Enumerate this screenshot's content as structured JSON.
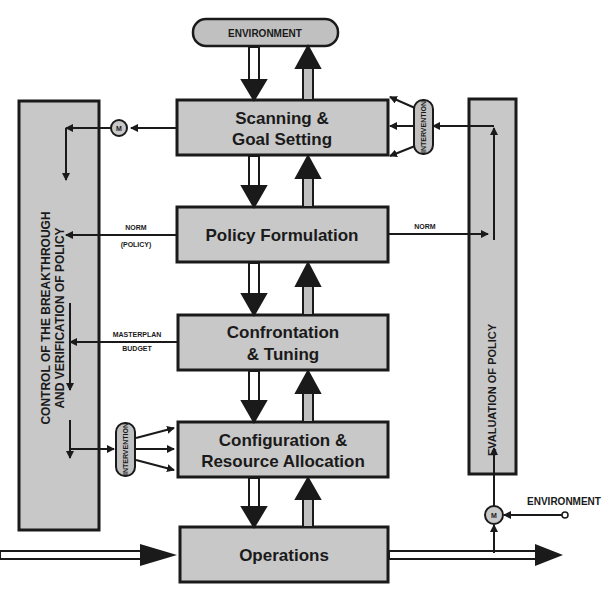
{
  "diagram": {
    "environment_top": "ENVIRONMENT",
    "environment_right": "ENVIRONMENT",
    "boxes": [
      {
        "line1": "Scanning &",
        "line2": "Goal Setting"
      },
      {
        "line1": "Policy Formulation",
        "line2": ""
      },
      {
        "line1": "Confrontation",
        "line2": "& Tuning"
      },
      {
        "line1": "Configuration &",
        "line2": "Resource Allocation"
      },
      {
        "line1": "Operations",
        "line2": ""
      }
    ],
    "left_panel": {
      "line1": "CONTROL OF THE BREAKTHROUGH",
      "line2": "AND VERIFICATION OF POLICY"
    },
    "right_panel": {
      "label": "EVALUATION OF POLICY"
    },
    "labels": {
      "norm_policy_1": "NORM",
      "norm_policy_2": "(POLICY)",
      "masterplan_1": "MASTERPLAN",
      "masterplan_2": "BUDGET",
      "norm_right": "NORM",
      "intervention_top": "INTERVENTION",
      "intervention_left": "INTERVENTION",
      "monitor_top": "M",
      "monitor_bottom": "M"
    },
    "colors": {
      "box_fill": "#c8c8c8",
      "stroke": "#1a1a1a",
      "pill_fill": "#c0c0c0"
    }
  }
}
